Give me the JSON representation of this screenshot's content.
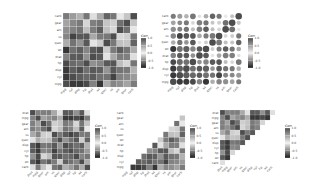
{
  "chart_data": {
    "type": "heatmap",
    "legend_title": "Corr",
    "legend_ticks": [
      "1.0",
      "0.5",
      "0.0",
      "-0.5",
      "-1.0"
    ],
    "legend_range": [
      -1,
      1
    ],
    "colors": {
      "low": "#1a1a1a",
      "mid": "#f2f2f2",
      "high": "#4d4d4d"
    },
    "variables": [
      "mpg",
      "cyl",
      "disp",
      "hp",
      "drat",
      "wt",
      "qsec",
      "vs",
      "am",
      "gear",
      "carb"
    ],
    "matrix": [
      [
        1.0,
        -0.85,
        -0.85,
        -0.78,
        0.68,
        -0.87,
        0.42,
        0.66,
        0.6,
        0.48,
        -0.55
      ],
      [
        -0.85,
        1.0,
        0.9,
        0.83,
        -0.7,
        0.78,
        -0.59,
        -0.81,
        -0.52,
        -0.49,
        0.53
      ],
      [
        -0.85,
        0.9,
        1.0,
        0.79,
        -0.71,
        0.89,
        -0.43,
        -0.71,
        -0.59,
        -0.56,
        0.39
      ],
      [
        -0.78,
        0.83,
        0.79,
        1.0,
        -0.45,
        0.66,
        -0.71,
        -0.72,
        -0.24,
        -0.13,
        0.75
      ],
      [
        0.68,
        -0.7,
        -0.71,
        -0.45,
        1.0,
        -0.71,
        0.09,
        0.44,
        0.71,
        0.7,
        -0.09
      ],
      [
        -0.87,
        0.78,
        0.89,
        0.66,
        -0.71,
        1.0,
        -0.17,
        -0.55,
        -0.69,
        -0.58,
        0.43
      ],
      [
        0.42,
        -0.59,
        -0.43,
        -0.71,
        0.09,
        -0.17,
        1.0,
        0.74,
        -0.23,
        -0.21,
        -0.66
      ],
      [
        0.66,
        -0.81,
        -0.71,
        -0.72,
        0.44,
        -0.55,
        0.74,
        1.0,
        0.17,
        0.21,
        -0.57
      ],
      [
        0.6,
        -0.52,
        -0.59,
        -0.24,
        0.71,
        -0.69,
        -0.23,
        0.17,
        1.0,
        0.79,
        0.06
      ],
      [
        0.48,
        -0.49,
        -0.56,
        -0.13,
        0.7,
        -0.58,
        -0.21,
        0.21,
        0.79,
        1.0,
        0.27
      ],
      [
        -0.55,
        0.53,
        0.39,
        0.75,
        -0.09,
        0.43,
        -0.66,
        -0.57,
        0.06,
        0.27,
        1.0
      ]
    ],
    "panels": [
      {
        "id": "full-square",
        "method": "square",
        "type": "full",
        "order": "original"
      },
      {
        "id": "full-circle",
        "method": "circle",
        "type": "full",
        "order": "original"
      },
      {
        "id": "hclust-square",
        "method": "square",
        "type": "full",
        "order": [
          "drat",
          "mpg",
          "gear",
          "am",
          "vs",
          "qsec",
          "disp",
          "cyl",
          "hp",
          "wt",
          "carb"
        ]
      },
      {
        "id": "lower-triangle",
        "method": "square",
        "type": "lower",
        "order": "original"
      },
      {
        "id": "upper-triangle",
        "method": "square",
        "type": "upper",
        "order": [
          "drat",
          "mpg",
          "gear",
          "am",
          "vs",
          "qsec",
          "disp",
          "cyl",
          "hp",
          "wt",
          "carb"
        ]
      }
    ]
  }
}
